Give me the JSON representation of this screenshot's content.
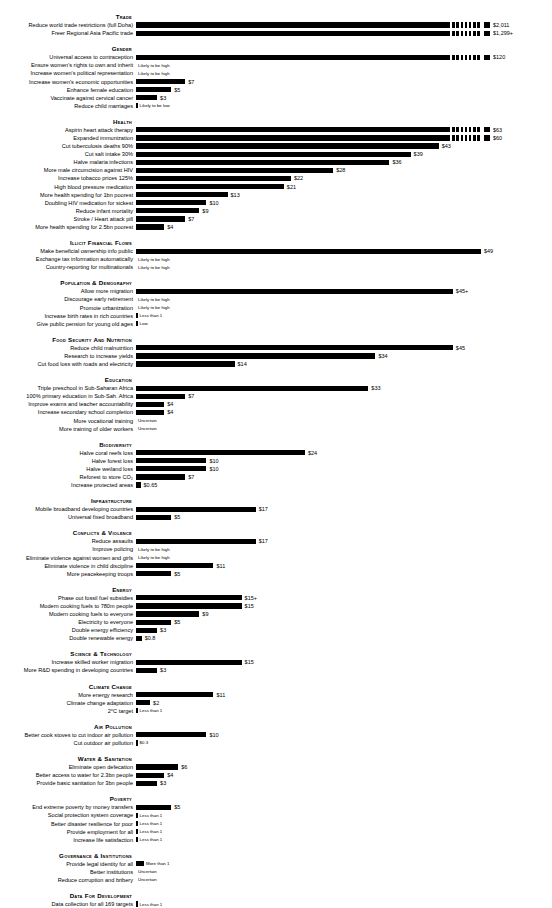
{
  "chart_data": {
    "type": "bar",
    "title": "",
    "xlabel": "",
    "ylabel": "",
    "value_unit": "dollars of social benefit per dollar spent",
    "max_value": 2011,
    "grid": false,
    "legend": [],
    "groups": [
      {
        "name": "Trade",
        "items": [
          {
            "label": "Reduce world trade restrictions (full Doha)",
            "value": 2011,
            "display": "$2,011",
            "style": "capped"
          },
          {
            "label": "Freer Regional Asia Pacific trade",
            "value": 1299,
            "display": "$1,299+",
            "style": "capped"
          }
        ]
      },
      {
        "name": "Gender",
        "items": [
          {
            "label": "Universal access to contraception",
            "value": 120,
            "display": "$120",
            "style": "capped"
          },
          {
            "label": "Ensure women's rights to own and inherit",
            "value": null,
            "display": "Likely to be high",
            "style": "note"
          },
          {
            "label": "Increase women's political representation",
            "value": null,
            "display": "Likely to be high",
            "style": "note"
          },
          {
            "label": "Increase women's economic opportunities",
            "value": 7,
            "display": "$7",
            "style": "bar"
          },
          {
            "label": "Enhance female education",
            "value": 5,
            "display": "$5",
            "style": "bar"
          },
          {
            "label": "Vaccinate against cervical cancer",
            "value": 3,
            "display": "$3",
            "style": "bar"
          },
          {
            "label": "Reduce child marriages",
            "value": null,
            "display": "Likely to be low",
            "style": "tick"
          }
        ]
      },
      {
        "name": "Health",
        "items": [
          {
            "label": "Aspirin heart attack therapy",
            "value": 63,
            "display": "$63",
            "style": "capped"
          },
          {
            "label": "Expanded immunization",
            "value": 60,
            "display": "$60",
            "style": "capped"
          },
          {
            "label": "Cut tuberculosis deaths 90%",
            "value": 43,
            "display": "$43",
            "style": "bar"
          },
          {
            "label": "Cut salt intake 30%",
            "value": 39,
            "display": "$39",
            "style": "bar"
          },
          {
            "label": "Halve malaria infections",
            "value": 36,
            "display": "$36",
            "style": "bar"
          },
          {
            "label": "More male circumcision against HIV",
            "value": 28,
            "display": "$28",
            "style": "bar"
          },
          {
            "label": "Increase tobacco prices 125%",
            "value": 22,
            "display": "$22",
            "style": "bar"
          },
          {
            "label": "High blood pressure medication",
            "value": 21,
            "display": "$21",
            "style": "bar"
          },
          {
            "label": "More health spending for 1bn poorest",
            "value": 13,
            "display": "$13",
            "style": "bar"
          },
          {
            "label": "Doubling HIV medication for sickest",
            "value": 10,
            "display": "$10",
            "style": "bar"
          },
          {
            "label": "Reduce infant mortality",
            "value": 9,
            "display": "$9",
            "style": "bar"
          },
          {
            "label": "Stroke / Heart attack pill",
            "value": 7,
            "display": "$7",
            "style": "bar"
          },
          {
            "label": "More health spending for 2.5bn poorest",
            "value": 4,
            "display": "$4",
            "style": "bar"
          }
        ]
      },
      {
        "name": "Illicit Financial Flows",
        "items": [
          {
            "label": "Make beneficial ownership info public",
            "value": 49,
            "display": "$49",
            "style": "bar"
          },
          {
            "label": "Exchange tax information automatically",
            "value": null,
            "display": "Likely to be high",
            "style": "note"
          },
          {
            "label": "Country-reporting for multinationals",
            "value": null,
            "display": "Likely to be high",
            "style": "note"
          }
        ]
      },
      {
        "name": "Population & Demography",
        "items": [
          {
            "label": "Allow more migration",
            "value": 45,
            "display": "$45+",
            "style": "bar"
          },
          {
            "label": "Discourage early retirement",
            "value": null,
            "display": "Likely to be high",
            "style": "note"
          },
          {
            "label": "Promote urbanization",
            "value": null,
            "display": "Likely to be high",
            "style": "note"
          },
          {
            "label": "Increase birth rates in rich countries",
            "value": null,
            "display": "Less than 1",
            "style": "tick"
          },
          {
            "label": "Give public pension for young old ages",
            "value": null,
            "display": "Low",
            "style": "tick"
          }
        ]
      },
      {
        "name": "Food Security and Nutrition",
        "items": [
          {
            "label": "Reduce child malnutrition",
            "value": 45,
            "display": "$45",
            "style": "bar"
          },
          {
            "label": "Research to increase yields",
            "value": 34,
            "display": "$34",
            "style": "bar"
          },
          {
            "label": "Cut food loss with roads and electricity",
            "value": 14,
            "display": "$14",
            "style": "bar"
          }
        ]
      },
      {
        "name": "Education",
        "items": [
          {
            "label": "Triple preschool in Sub-Saharan Africa",
            "value": 33,
            "display": "$33",
            "style": "bar"
          },
          {
            "label": "100% primary education in Sub-Sah. Africa",
            "value": 7,
            "display": "$7",
            "style": "bar"
          },
          {
            "label": "Improve exams and teacher accountability",
            "value": 4,
            "display": "$4",
            "style": "bar"
          },
          {
            "label": "Increase secondary school completion",
            "value": 4,
            "display": "$4",
            "style": "bar"
          },
          {
            "label": "More vocational training",
            "value": null,
            "display": "Uncertain",
            "style": "note"
          },
          {
            "label": "More training of older workers",
            "value": null,
            "display": "Uncertain",
            "style": "note"
          }
        ]
      },
      {
        "name": "Biodiversity",
        "items": [
          {
            "label": "Halve coral reefs loss",
            "value": 24,
            "display": "$24",
            "style": "bar"
          },
          {
            "label": "Halve forest loss",
            "value": 10,
            "display": "$10",
            "style": "bar"
          },
          {
            "label": "Halve wetland loss",
            "value": 10,
            "display": "$10",
            "style": "bar"
          },
          {
            "label": "Reforest to store CO₂",
            "value": 7,
            "display": "$7",
            "style": "bar"
          },
          {
            "label": "Increase protected areas",
            "value": 0.65,
            "display": "$0.65",
            "style": "bar"
          }
        ]
      },
      {
        "name": "Infrastructure",
        "items": [
          {
            "label": "Mobile broadband developing countries",
            "value": 17,
            "display": "$17",
            "style": "bar"
          },
          {
            "label": "Universal fixed broadband",
            "value": 5,
            "display": "$5",
            "style": "bar"
          }
        ]
      },
      {
        "name": "Conflicts & Violence",
        "items": [
          {
            "label": "Reduce assaults",
            "value": 17,
            "display": "$17",
            "style": "bar"
          },
          {
            "label": "Improve policing",
            "value": null,
            "display": "Likely to be high",
            "style": "note"
          },
          {
            "label": "Eliminate violence against women and girls",
            "value": null,
            "display": "Likely to be high",
            "style": "note"
          },
          {
            "label": "Eliminate violence in child discipline",
            "value": 11,
            "display": "$11",
            "style": "bar"
          },
          {
            "label": "More peacekeeping troops",
            "value": 5,
            "display": "$5",
            "style": "bar"
          }
        ]
      },
      {
        "name": "Energy",
        "items": [
          {
            "label": "Phase out fossil fuel subsidies",
            "value": 15,
            "display": "$15+",
            "style": "bar"
          },
          {
            "label": "Modern cooking fuels to 780m people",
            "value": 15,
            "display": "$15",
            "style": "bar"
          },
          {
            "label": "Modern cooking fuels to everyone",
            "value": 9,
            "display": "$9",
            "style": "bar"
          },
          {
            "label": "Electricity to everyone",
            "value": 5,
            "display": "$5",
            "style": "bar"
          },
          {
            "label": "Double energy efficiency",
            "value": 3,
            "display": "$3",
            "style": "bar"
          },
          {
            "label": "Double renewable energy",
            "value": 0.8,
            "display": "$0.8",
            "style": "bar"
          }
        ]
      },
      {
        "name": "Science & technology",
        "items": [
          {
            "label": "Increase skilled worker migration",
            "value": 15,
            "display": "$15",
            "style": "bar"
          },
          {
            "label": "More R&D spending in developing countries",
            "value": 3,
            "display": "$3",
            "style": "bar"
          }
        ]
      },
      {
        "name": "Climate Change",
        "items": [
          {
            "label": "More energy research",
            "value": 11,
            "display": "$11",
            "style": "bar"
          },
          {
            "label": "Climate change adaptation",
            "value": 2,
            "display": "$2",
            "style": "bar"
          },
          {
            "label": "2°C target",
            "value": null,
            "display": "Less than 1",
            "style": "tick"
          }
        ]
      },
      {
        "name": "Air Pollution",
        "items": [
          {
            "label": "Better cook stoves to cut indoor air pollution",
            "value": 10,
            "display": "$10",
            "style": "bar"
          },
          {
            "label": "Cut outdoor air pollution",
            "value": 0.3,
            "display": "$0.3",
            "style": "tick"
          }
        ]
      },
      {
        "name": "Water & Sanitation",
        "items": [
          {
            "label": "Eliminate open defecation",
            "value": 6,
            "display": "$6",
            "style": "bar"
          },
          {
            "label": "Better access to water for 2.3bn people",
            "value": 4,
            "display": "$4",
            "style": "bar"
          },
          {
            "label": "Provide basic sanitation for 3bn people",
            "value": 3,
            "display": "$3",
            "style": "bar"
          }
        ]
      },
      {
        "name": "Poverty",
        "items": [
          {
            "label": "End extreme poverty by money transfers",
            "value": 5,
            "display": "$5",
            "style": "bar"
          },
          {
            "label": "Social protection system coverage",
            "value": null,
            "display": "Less than 1",
            "style": "tick"
          },
          {
            "label": "Better disaster resilience for poor",
            "value": null,
            "display": "Less than 1",
            "style": "tick"
          },
          {
            "label": "Provide employment for all",
            "value": null,
            "display": "Less than 1",
            "style": "tick"
          },
          {
            "label": "Increase life satisfaction",
            "value": null,
            "display": "Less than 1",
            "style": "tick"
          }
        ]
      },
      {
        "name": "Governance & Institutions",
        "items": [
          {
            "label": "Provide legal identity for all",
            "value": null,
            "display": "More than 1",
            "style": "stub"
          },
          {
            "label": "Better institutions",
            "value": null,
            "display": "Uncertain",
            "style": "note"
          },
          {
            "label": "Reduce corruption and bribery",
            "value": null,
            "display": "Uncertain",
            "style": "note"
          }
        ]
      },
      {
        "name": "Data for Development",
        "items": [
          {
            "label": "Data collection for all 169 targets",
            "value": null,
            "display": "Less than 1",
            "style": "tick"
          }
        ]
      }
    ]
  }
}
